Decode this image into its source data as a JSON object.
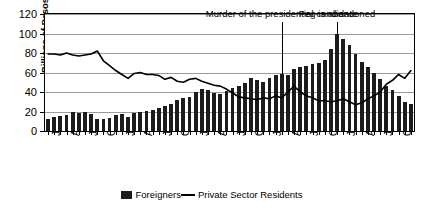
{
  "chart_data": {
    "type": "bar",
    "title": "",
    "xlabel": "",
    "ylabel": "Billions of Pesos",
    "ylim": [
      0,
      120
    ],
    "ytick_values": [
      0,
      20,
      40,
      60,
      80,
      100,
      120
    ],
    "ytick_labels": [
      "0",
      "20",
      "40",
      "60",
      "80",
      "100",
      "120"
    ],
    "grid": true,
    "legend_position": "bottom-center",
    "x": [
      "Jan-91",
      "Feb-91",
      "Mar-91",
      "Apr-91",
      "May-91",
      "Jun-91",
      "Jul-91",
      "Aug-91",
      "Sep-91",
      "Oct-91",
      "Nov-91",
      "Dec-91",
      "Jan-92",
      "Feb-92",
      "Mar-92",
      "Apr-92",
      "May-92",
      "Jun-92",
      "Jul-92",
      "Aug-92",
      "Sep-92",
      "Oct-92",
      "Nov-92",
      "Dec-92",
      "Jan-93",
      "Feb-93",
      "Mar-93",
      "Apr-93",
      "May-93",
      "Jun-93",
      "Jul-93",
      "Aug-93",
      "Sep-93",
      "Oct-93",
      "Nov-93",
      "Dec-93",
      "Jan-94",
      "Feb-94",
      "Mar-94",
      "Apr-94",
      "May-94",
      "Jun-94",
      "Jul-94",
      "Aug-94",
      "Sep-94",
      "Oct-94",
      "Nov-94",
      "Dec-94",
      "Jan-95",
      "Feb-95",
      "Mar-95",
      "Apr-95",
      "May-95",
      "Jun-95",
      "Jul-95",
      "Aug-95",
      "Sep-95",
      "Oct-95",
      "Nov-95",
      "Dec-95"
    ],
    "xtick_labels": [
      "Jan-91",
      "Apr-91",
      "Jul-91",
      "Oct-91",
      "Jan-92",
      "Apr-92",
      "Jul-92",
      "Oct-92",
      "Jan-93",
      "Apr-93",
      "Jul-93",
      "Oct-93",
      "Jan-94",
      "Apr-94",
      "Jul-94",
      "Oct-94",
      "Jan-95",
      "Apr-95",
      "Jul-95",
      "Oct-95"
    ],
    "xtick_indices": [
      0,
      3,
      6,
      9,
      12,
      15,
      18,
      21,
      24,
      27,
      30,
      33,
      36,
      39,
      42,
      45,
      48,
      51,
      54,
      57
    ],
    "series": [
      {
        "name": "Foreigners",
        "type": "bar",
        "color": "#1c1c1c",
        "values": [
          12,
          14,
          15,
          16,
          19,
          18,
          19,
          17,
          12,
          12,
          13,
          16,
          17,
          14,
          18,
          20,
          21,
          22,
          24,
          26,
          28,
          32,
          34,
          35,
          40,
          43,
          42,
          39,
          38,
          41,
          44,
          46,
          49,
          54,
          52,
          50,
          54,
          57,
          58,
          57,
          64,
          66,
          67,
          69,
          70,
          73,
          84,
          100,
          94,
          88,
          79,
          71,
          66,
          60,
          53,
          46,
          42,
          36,
          30,
          28
        ]
      },
      {
        "name": "Private Sector Residents",
        "type": "line",
        "color": "#000000",
        "values": [
          79,
          79,
          78,
          80,
          78,
          77,
          78,
          79,
          82,
          72,
          67,
          62,
          58,
          54,
          59,
          60,
          58,
          58,
          57,
          53,
          55,
          51,
          50,
          53,
          54,
          51,
          49,
          47,
          46,
          43,
          39,
          35,
          34,
          33,
          32,
          34,
          33,
          36,
          34,
          40,
          46,
          40,
          36,
          34,
          31,
          31,
          30,
          31,
          33,
          30,
          27,
          29,
          33,
          36,
          40,
          48,
          52,
          58,
          54,
          62
        ]
      }
    ],
    "annotations": [
      {
        "text": "Murder of the presidential candidate",
        "target_index": 38
      },
      {
        "text": "Peg is abandoned",
        "target_index": 47
      }
    ]
  },
  "legend": {
    "items": [
      {
        "label": "Foreigners",
        "marker": "bar-swatch"
      },
      {
        "label": "Private Sector Residents",
        "marker": "line-swatch"
      }
    ]
  }
}
